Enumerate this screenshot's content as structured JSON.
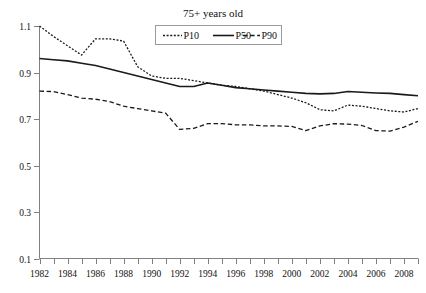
{
  "chart_data": {
    "type": "line",
    "title": "75+ years old",
    "xlabel": "",
    "ylabel": "",
    "grid": false,
    "legend_position": "top-center",
    "xlim": [
      1982,
      2009
    ],
    "ylim": [
      0.1,
      1.1
    ],
    "ytick_labels": [
      "0.1",
      "0.3",
      "0.5",
      "0.7",
      "0.9",
      "1.1"
    ],
    "yticks": [
      0.1,
      0.3,
      0.5,
      0.7,
      0.9,
      1.1
    ],
    "xtick_labels": [
      "1982",
      "1984",
      "1986",
      "1988",
      "1990",
      "1992",
      "1994",
      "1996",
      "1998",
      "2000",
      "2002",
      "2004",
      "2006",
      "2008"
    ],
    "xticks": [
      1982,
      1984,
      1986,
      1988,
      1990,
      1992,
      1994,
      1996,
      1998,
      2000,
      2002,
      2004,
      2006,
      2008
    ],
    "x": [
      1982,
      1983,
      1984,
      1985,
      1986,
      1987,
      1988,
      1989,
      1990,
      1991,
      1992,
      1993,
      1994,
      1995,
      1996,
      1997,
      1998,
      1999,
      2000,
      2001,
      2002,
      2003,
      2004,
      2005,
      2006,
      2007,
      2008,
      2009
    ],
    "series": [
      {
        "name": "P10",
        "style": "dotted",
        "color": "#1a1a1a",
        "values": [
          1.1,
          1.055,
          1.015,
          0.975,
          1.045,
          1.045,
          1.035,
          0.925,
          0.885,
          0.875,
          0.875,
          0.865,
          0.855,
          0.845,
          0.84,
          0.83,
          0.82,
          0.805,
          0.79,
          0.77,
          0.74,
          0.735,
          0.76,
          0.755,
          0.745,
          0.735,
          0.73,
          0.745
        ]
      },
      {
        "name": "P50",
        "style": "solid",
        "color": "#1a1a1a",
        "values": [
          0.96,
          0.955,
          0.95,
          0.94,
          0.93,
          0.915,
          0.9,
          0.885,
          0.87,
          0.855,
          0.84,
          0.84,
          0.855,
          0.845,
          0.835,
          0.83,
          0.825,
          0.82,
          0.815,
          0.81,
          0.808,
          0.81,
          0.818,
          0.815,
          0.812,
          0.81,
          0.805,
          0.8
        ]
      },
      {
        "name": "P90",
        "style": "dashed",
        "color": "#1a1a1a",
        "values": [
          0.82,
          0.818,
          0.805,
          0.79,
          0.785,
          0.775,
          0.755,
          0.745,
          0.735,
          0.725,
          0.655,
          0.66,
          0.68,
          0.68,
          0.675,
          0.675,
          0.67,
          0.67,
          0.668,
          0.65,
          0.67,
          0.68,
          0.678,
          0.672,
          0.65,
          0.648,
          0.665,
          0.69
        ]
      }
    ]
  },
  "legend": {
    "entries": [
      {
        "label": "P10"
      },
      {
        "label": "P50"
      },
      {
        "label": "P90"
      }
    ]
  }
}
